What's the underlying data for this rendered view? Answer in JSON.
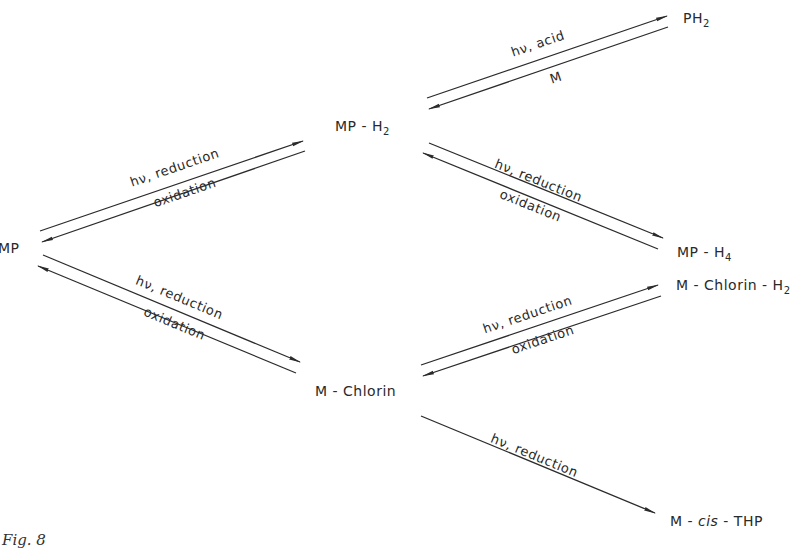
{
  "nodes": {
    "mp": {
      "text": "MP"
    },
    "mp_h2": {
      "base": "MP - H",
      "sub": "2"
    },
    "ph2": {
      "base": "PH",
      "sub": "2"
    },
    "mp_h4": {
      "base": "MP - H",
      "sub": "4"
    },
    "m_chlorin": {
      "text": "M - Chlorin"
    },
    "m_chlorin_h2": {
      "base": "M - Chlorin - H",
      "sub": "2"
    },
    "m_cis_thp": {
      "pre": "M - ",
      "italic": "cis",
      "post": " - THP"
    }
  },
  "edges": [
    {
      "from": "MP",
      "to": "MP - H2",
      "forward": "hν, reduction",
      "reverse": "oxidation"
    },
    {
      "from": "MP - H2",
      "to": "PH2",
      "forward": "hν, acid",
      "reverse": "M"
    },
    {
      "from": "MP - H2",
      "to": "MP - H4",
      "forward": "hν, reduction",
      "reverse": "oxidation"
    },
    {
      "from": "MP",
      "to": "M - Chlorin",
      "forward": "hν, reduction",
      "reverse": "oxidation"
    },
    {
      "from": "M - Chlorin",
      "to": "M - Chlorin - H2",
      "forward": "hν, reduction",
      "reverse": "oxidation"
    },
    {
      "from": "M - Chlorin",
      "to": "M - cis - THP",
      "forward": "hν, reduction"
    }
  ],
  "caption": {
    "text": "Fig. 8"
  },
  "colors": {
    "line": "#2b2b2b",
    "text": "#2a2a2a",
    "background": "#ffffff"
  }
}
